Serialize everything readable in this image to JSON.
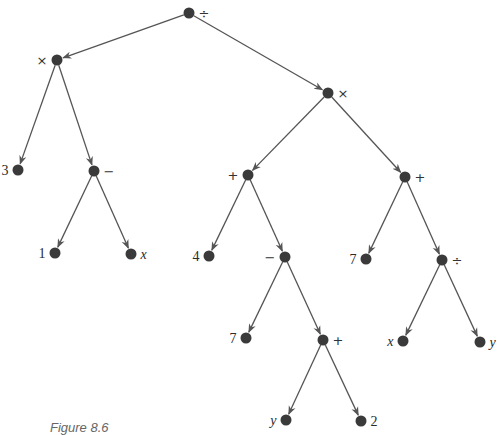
{
  "caption": "Figure 8.6",
  "colors": {
    "node": "#3a3a3a",
    "edge": "#555555",
    "text": "#2a2a2a"
  },
  "nodes": [
    {
      "id": "n0",
      "label": "÷",
      "x": 189,
      "y": 13,
      "label_side": "right",
      "kind": "op"
    },
    {
      "id": "n1",
      "label": "×",
      "x": 57,
      "y": 60,
      "label_side": "left",
      "kind": "op"
    },
    {
      "id": "n2",
      "label": "×",
      "x": 328,
      "y": 93,
      "label_side": "right",
      "kind": "op"
    },
    {
      "id": "n3",
      "label": "3",
      "x": 18,
      "y": 170,
      "label_side": "left",
      "kind": "num"
    },
    {
      "id": "n4",
      "label": "−",
      "x": 94,
      "y": 171,
      "label_side": "right",
      "kind": "op"
    },
    {
      "id": "n5",
      "label": "+",
      "x": 248,
      "y": 175,
      "label_side": "left",
      "kind": "op"
    },
    {
      "id": "n6",
      "label": "+",
      "x": 405,
      "y": 177,
      "label_side": "right",
      "kind": "op"
    },
    {
      "id": "n7",
      "label": "1",
      "x": 55,
      "y": 253,
      "label_side": "left",
      "kind": "num"
    },
    {
      "id": "n8",
      "label": "x",
      "x": 131,
      "y": 254,
      "label_side": "right",
      "kind": "var"
    },
    {
      "id": "n9",
      "label": "4",
      "x": 209,
      "y": 256,
      "label_side": "left",
      "kind": "num"
    },
    {
      "id": "n10",
      "label": "−",
      "x": 285,
      "y": 257,
      "label_side": "left",
      "kind": "op"
    },
    {
      "id": "n11",
      "label": "7",
      "x": 366,
      "y": 259,
      "label_side": "left",
      "kind": "num"
    },
    {
      "id": "n12",
      "label": "÷",
      "x": 442,
      "y": 260,
      "label_side": "right",
      "kind": "op"
    },
    {
      "id": "n13",
      "label": "7",
      "x": 246,
      "y": 338,
      "label_side": "left",
      "kind": "num"
    },
    {
      "id": "n14",
      "label": "+",
      "x": 323,
      "y": 340,
      "label_side": "right",
      "kind": "op"
    },
    {
      "id": "n15",
      "label": "x",
      "x": 403,
      "y": 341,
      "label_side": "left",
      "kind": "var"
    },
    {
      "id": "n16",
      "label": "y",
      "x": 480,
      "y": 342,
      "label_side": "right",
      "kind": "var"
    },
    {
      "id": "n17",
      "label": "y",
      "x": 286,
      "y": 420,
      "label_side": "left",
      "kind": "var"
    },
    {
      "id": "n18",
      "label": "2",
      "x": 361,
      "y": 421,
      "label_side": "right",
      "kind": "num"
    }
  ],
  "edges": [
    [
      "n0",
      "n1"
    ],
    [
      "n0",
      "n2"
    ],
    [
      "n1",
      "n3"
    ],
    [
      "n1",
      "n4"
    ],
    [
      "n4",
      "n7"
    ],
    [
      "n4",
      "n8"
    ],
    [
      "n2",
      "n5"
    ],
    [
      "n2",
      "n6"
    ],
    [
      "n5",
      "n9"
    ],
    [
      "n5",
      "n10"
    ],
    [
      "n10",
      "n13"
    ],
    [
      "n10",
      "n14"
    ],
    [
      "n14",
      "n17"
    ],
    [
      "n14",
      "n18"
    ],
    [
      "n6",
      "n11"
    ],
    [
      "n6",
      "n12"
    ],
    [
      "n12",
      "n15"
    ],
    [
      "n12",
      "n16"
    ]
  ]
}
